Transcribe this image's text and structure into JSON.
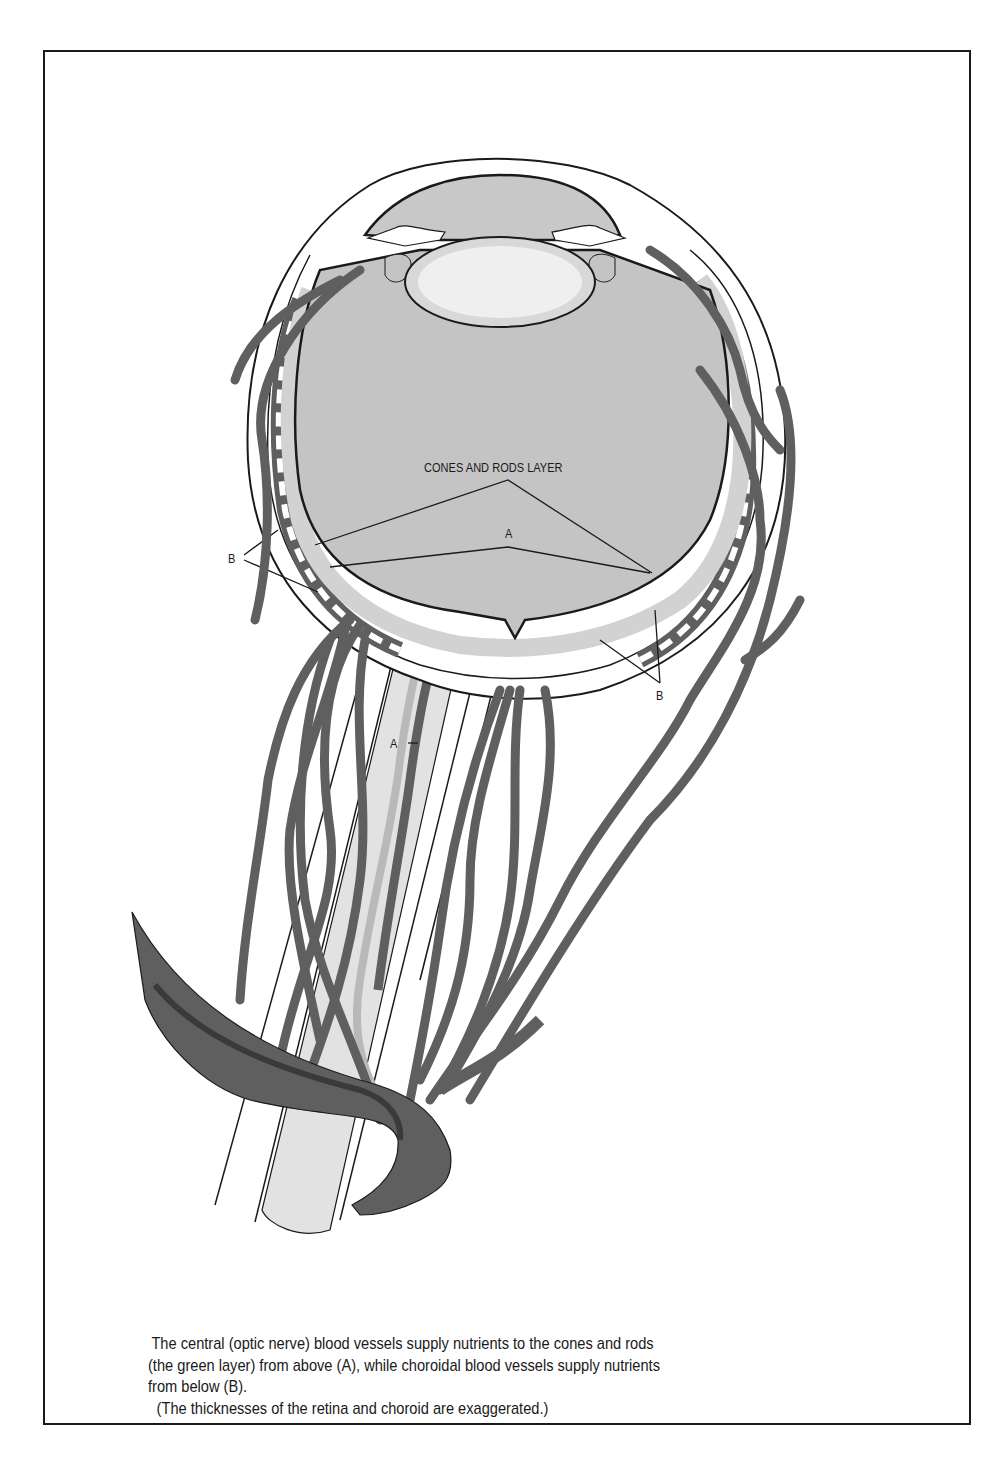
{
  "figure": {
    "labels": {
      "cones_rods_layer": "CONES AND RODS LAYER",
      "a_retina": "A",
      "a_nerve": "A",
      "b_left": "B",
      "b_right": "B"
    },
    "colors": {
      "vessel": "#5f5f5f",
      "vessel_dark": "#3a3a3a",
      "vitreous": "#c4c4c4",
      "retina_layer": "#dcdcdc",
      "lens": "#ececec",
      "outline": "#1a1a1a",
      "nerve": "#e2e2e2"
    },
    "caption": {
      "line1": "The central (optic nerve) blood vessels supply nutrients to the cones and rods",
      "line2": "(the green layer) from above (A), while choroidal blood vessels supply nutrients",
      "line3": "from below (B).",
      "line4": "(The thicknesses of the retina and choroid are exaggerated.)"
    }
  }
}
